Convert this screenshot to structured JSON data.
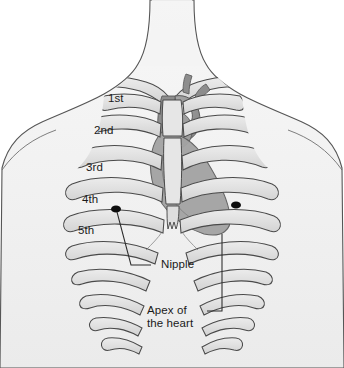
{
  "illustration": {
    "title": "Anterior thoracic wall showing rib numbering, heart position, nipple and cardiac apex",
    "background_color": "#ffffff",
    "body_fill": "#f2f2f2",
    "bone_fill": "#e3e3e3",
    "bone_shadow": "#c9c9c9",
    "heart_fill": "#9a9a9a",
    "heart_dark": "#7d7d7d",
    "outline_color": "#4a4a4a",
    "marker_color": "#0d0d0d",
    "leader_color": "#2b2b2b",
    "text_color": "#1a1a1a"
  },
  "rib_labels": [
    {
      "id": "rib-1",
      "text": "1st",
      "x": 108,
      "y": 98
    },
    {
      "id": "rib-2",
      "text": "2nd",
      "x": 94,
      "y": 130
    },
    {
      "id": "rib-3",
      "text": "3rd",
      "x": 86,
      "y": 167
    },
    {
      "id": "rib-4",
      "text": "4th",
      "x": 82,
      "y": 199
    },
    {
      "id": "rib-5",
      "text": "5th",
      "x": 78,
      "y": 230
    }
  ],
  "callouts": [
    {
      "id": "nipple",
      "text": "Nipple",
      "x": 161,
      "y": 259,
      "leader": {
        "x1": 150,
        "y1": 265,
        "x2": 130,
        "y2": 265,
        "x3": 116,
        "y3": 209
      },
      "marker": {
        "x": 116,
        "y": 209
      }
    },
    {
      "id": "apex-of-the-heart",
      "line1": "Apex of",
      "line2": "the heart",
      "x": 147,
      "y": 305,
      "leader": {
        "x1": 207,
        "y1": 311,
        "x2": 222,
        "y2": 311,
        "x3": 222,
        "y3": 232
      }
    }
  ],
  "markers": [
    {
      "id": "nipple-left",
      "x": 116,
      "y": 209
    },
    {
      "id": "nipple-right",
      "x": 236,
      "y": 205
    }
  ]
}
